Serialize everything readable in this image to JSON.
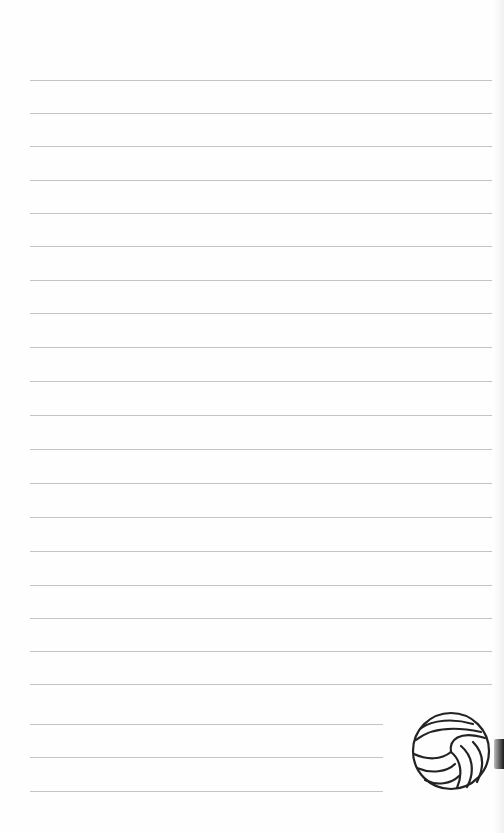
{
  "page": {
    "type": "lined-notepaper",
    "background_color": "#fefefe",
    "line_color": "#c4c4c4",
    "show_through_text": "",
    "full_width_lines": {
      "x_start": 30,
      "x_end": 492,
      "y_positions": [
        80,
        113,
        146,
        180,
        213,
        246,
        280,
        313,
        347,
        381,
        415,
        449,
        483,
        517,
        551,
        585,
        618,
        651,
        684
      ]
    },
    "short_lines": {
      "x_start": 30,
      "x_end": 383,
      "y_positions": [
        724,
        757,
        791
      ]
    },
    "decoration": {
      "icon": "volleyball-icon",
      "center_x": 451,
      "center_y": 751,
      "radius": 38,
      "stroke_color": "#222222"
    },
    "edge_tab_color": "#1a1a1a"
  }
}
